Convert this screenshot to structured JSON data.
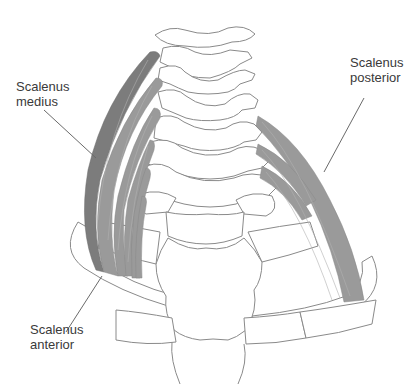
{
  "figure": {
    "type": "anatomical-diagram",
    "colors": {
      "muscle_dark": "#7c7c7c",
      "muscle_light": "#9a9a9a",
      "bone_outline": "#8a8a8a",
      "label_text": "#3a3a3a",
      "background": "#ffffff"
    }
  },
  "labels": {
    "medius": {
      "line1": "Scalenus",
      "line2": "medius"
    },
    "posterior": {
      "line1": "Scalenus",
      "line2": "posterior"
    },
    "anterior": {
      "line1": "Scalenus",
      "line2": "anterior"
    }
  }
}
